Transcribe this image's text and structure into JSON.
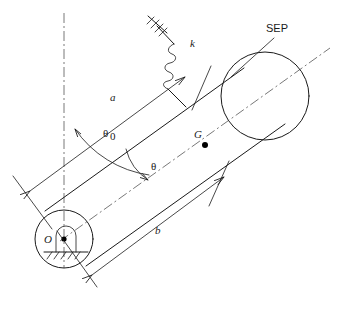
{
  "figure": {
    "type": "mechanical-schematic",
    "labels": {
      "pivot": "O",
      "center_of_gravity": "G",
      "spring": "k",
      "distance_spring": "a",
      "distance_cg": "b",
      "angle_static": "θ",
      "angle_static_sub": "0",
      "angle_dynamic": "θ",
      "equilibrium": "SEP"
    },
    "elements": {
      "pivot_label": "O",
      "cg_label": "G",
      "spring_label": "k",
      "dim_a_label": "a",
      "dim_b_label": "b",
      "theta0_label": "θ",
      "theta0_subscript": "0",
      "theta_label": "θ",
      "sep_label": "SEP"
    },
    "colors": {
      "line": "#1a1a1a",
      "centerline": "#555555",
      "background": "#ffffff"
    }
  }
}
